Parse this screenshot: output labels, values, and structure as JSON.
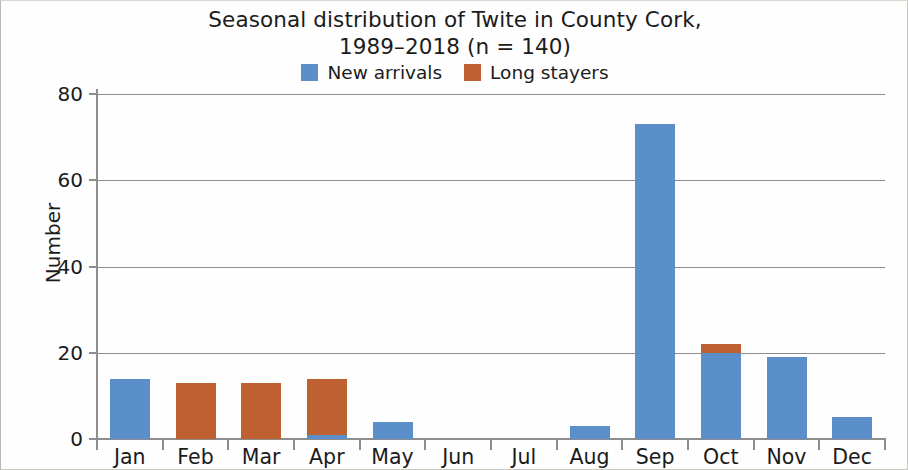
{
  "chart_data": {
    "type": "bar",
    "title": "Seasonal distribution of Twite in County Cork, 1989–2018 (n = 140)",
    "title_lines": [
      "Seasonal distribution of Twite in County Cork,",
      "1989–2018 (n = 140)"
    ],
    "xlabel": "",
    "ylabel": "Number",
    "categories": [
      "Jan",
      "Feb",
      "Mar",
      "Apr",
      "May",
      "Jun",
      "Jul",
      "Aug",
      "Sep",
      "Oct",
      "Nov",
      "Dec"
    ],
    "series": [
      {
        "name": "New arrivals",
        "color": "#5b8fc9",
        "values": [
          14,
          0,
          0,
          1,
          4,
          0,
          0,
          3,
          73,
          20,
          19,
          5
        ]
      },
      {
        "name": "Long stayers",
        "color": "#bf6030",
        "values": [
          0,
          13,
          13,
          13,
          0,
          0,
          0,
          0,
          0,
          2,
          0,
          0
        ]
      }
    ],
    "stacked": true,
    "ylim": [
      0,
      80
    ],
    "yticks": [
      0,
      20,
      40,
      60,
      80
    ],
    "ytick_labels": [
      "0",
      "20",
      "40",
      "60",
      "80"
    ],
    "grid": true,
    "grid_axis": "y",
    "legend_position": "top-center",
    "background_color": "#fefefe",
    "axis_color": "#8d8d8d",
    "text_color": "#1b1b1b"
  },
  "legend": {
    "entries": [
      {
        "label": "New arrivals",
        "color": "#5b8fc9"
      },
      {
        "label": "Long stayers",
        "color": "#bf6030"
      }
    ]
  }
}
